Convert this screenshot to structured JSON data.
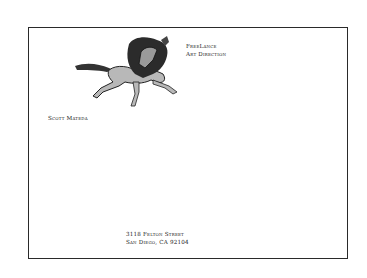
{
  "card": {
    "logo": "horse-and-rider-illustration",
    "firm": {
      "line1": "FreeLance",
      "line2": "Art Direction"
    },
    "name": "Scott Mateda",
    "address": {
      "street": "3118 Felton Street",
      "city": "San Diego, CA 92104"
    }
  }
}
